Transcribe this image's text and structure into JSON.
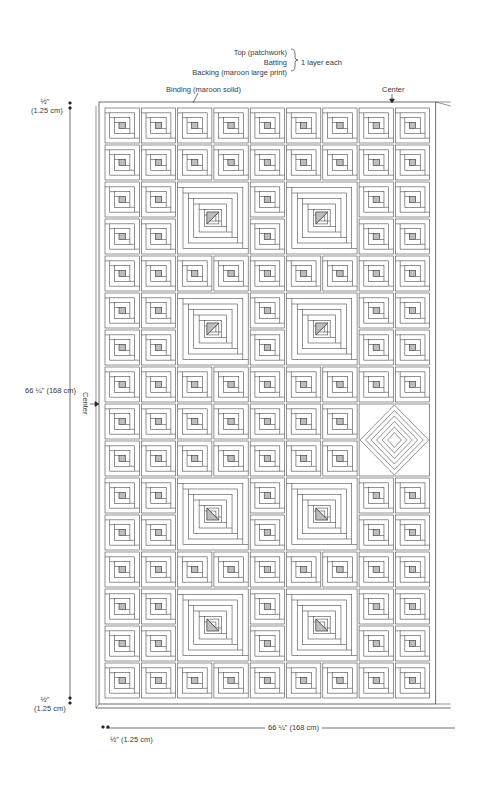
{
  "labels": {
    "layers": [
      "Top (patchwork)",
      "Batting",
      "Backing (maroon large print)"
    ],
    "layers_note": "1 layer each",
    "binding": "Binding (maroon solid)",
    "center_top": "Center",
    "center_left": "Center",
    "top_margin": {
      "fraction": "½\"",
      "metric": "(1.25 cm)"
    },
    "bottom_margin": {
      "fraction": "½\"",
      "metric": "(1.25 cm)"
    },
    "height_dim": "66 ¼\" (168 cm)",
    "width_dim": "66 ¼\" (168 cm)",
    "left_margin": "½\" (1.25 cm)"
  },
  "quilt": {
    "columns": 9,
    "rows": 16,
    "grid_origin": [
      104,
      107
    ],
    "cell_w": 36.3,
    "cell_h": 37.0,
    "large_blocks": [
      {
        "col": 2,
        "row": 2,
        "triangle": "upper-left"
      },
      {
        "col": 5,
        "row": 2,
        "triangle": "upper-left"
      },
      {
        "col": 2,
        "row": 5,
        "triangle": "upper-left"
      },
      {
        "col": 5,
        "row": 5,
        "triangle": "upper-left"
      },
      {
        "col": 2,
        "row": 10,
        "triangle": "lower-left"
      },
      {
        "col": 5,
        "row": 10,
        "triangle": "lower-left"
      },
      {
        "col": 2,
        "row": 13,
        "triangle": "lower-left"
      },
      {
        "col": 5,
        "row": 13,
        "triangle": "lower-left"
      }
    ],
    "diamond_block": {
      "col": 7,
      "row": 8
    },
    "colors": {
      "line": "#4a4a4a",
      "shade": "#bdbdbd",
      "background": "#ffffff"
    }
  }
}
